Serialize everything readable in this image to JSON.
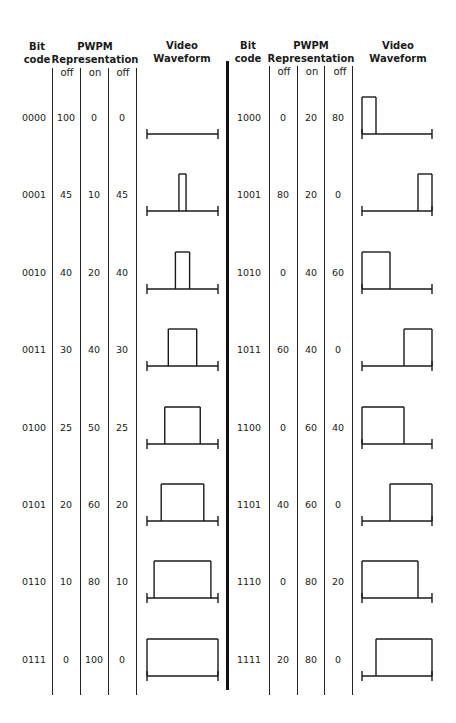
{
  "table": {
    "headers": {
      "bit_code": [
        "Bit",
        "code"
      ],
      "pwpm": [
        "PWPM",
        "Representation"
      ],
      "video": [
        "Video",
        "Waveform"
      ],
      "sub": [
        "off",
        "on",
        "off"
      ]
    },
    "left_rows": [
      {
        "code": "0000",
        "off1": "100",
        "on": "0",
        "off2": "0"
      },
      {
        "code": "0001",
        "off1": "45",
        "on": "10",
        "off2": "45"
      },
      {
        "code": "0010",
        "off1": "40",
        "on": "20",
        "off2": "40"
      },
      {
        "code": "0011",
        "off1": "30",
        "on": "40",
        "off2": "30"
      },
      {
        "code": "0100",
        "off1": "25",
        "on": "50",
        "off2": "25"
      },
      {
        "code": "0101",
        "off1": "20",
        "on": "60",
        "off2": "20"
      },
      {
        "code": "0110",
        "off1": "10",
        "on": "80",
        "off2": "10"
      },
      {
        "code": "0111",
        "off1": "0",
        "on": "100",
        "off2": "0"
      }
    ],
    "right_rows": [
      {
        "code": "1000",
        "off1": "0",
        "on": "20",
        "off2": "80"
      },
      {
        "code": "1001",
        "off1": "80",
        "on": "20",
        "off2": "0"
      },
      {
        "code": "1010",
        "off1": "0",
        "on": "40",
        "off2": "60"
      },
      {
        "code": "1011",
        "off1": "60",
        "on": "40",
        "off2": "0"
      },
      {
        "code": "1100",
        "off1": "0",
        "on": "60",
        "off2": "40"
      },
      {
        "code": "1101",
        "off1": "40",
        "on": "60",
        "off2": "0"
      },
      {
        "code": "1110",
        "off1": "0",
        "on": "80",
        "off2": "20"
      },
      {
        "code": "1111",
        "off1": "20",
        "on": "80",
        "off2": "0"
      }
    ]
  },
  "colors": {
    "ink": "#1a1a1a",
    "background": "#ffffff"
  }
}
